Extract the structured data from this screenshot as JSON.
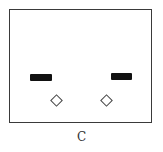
{
  "figure": {
    "panel_label": "C",
    "lanes": [
      {
        "position": "left",
        "band": "dark",
        "spot": "diamond-outline"
      },
      {
        "position": "right",
        "band": "dark",
        "spot": "diamond-outline"
      }
    ],
    "colors": {
      "frame": "#3a3a3a",
      "band": "#111111",
      "background": "#ffffff"
    }
  }
}
